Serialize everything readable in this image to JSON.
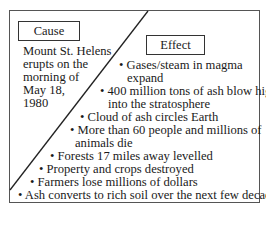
{
  "diagram": {
    "type": "cause-effect",
    "cause": {
      "label": "Cause",
      "lines": [
        "Mount St. Helens",
        "erupts on the",
        "morning of",
        "May 18,",
        "1980"
      ],
      "text": "Mount St. Helens erupts on the morning of May 18, 1980"
    },
    "effect": {
      "label": "Effect",
      "items": [
        "Gases/steam in magma expand",
        "400 million tons of ash blow high into the stratosphere",
        "Cloud of ash circles Earth",
        "More than 60 people and millions of animals die",
        "Forests 17 miles away levelled",
        "Property and crops destroyed",
        "Farmers lose millions of dollars",
        "Ash converts to rich soil over the next few decades"
      ],
      "lines": [
        "• Gases/steam in magma",
        "expand",
        "• 400 million tons of ash blow high",
        "into the stratosphere",
        "• Cloud of ash circles Earth",
        "• More than 60 people and millions of",
        "animals die",
        "• Forests 17 miles away levelled",
        "• Property and crops destroyed",
        "• Farmers lose millions of dollars",
        "• Ash converts to rich soil over the next few decades"
      ]
    },
    "colors": {
      "border": "#555555",
      "text": "#1a1a1a",
      "background": "#ffffff"
    }
  }
}
